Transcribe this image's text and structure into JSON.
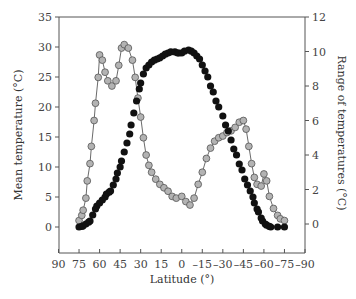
{
  "chart_data": {
    "type": "scatter",
    "title": "",
    "xlabel": "Latitude (°)",
    "ylabel": "Mean temperature (°C)",
    "ylabel_right": "Range of temperatures (°C)",
    "x_ticks": [
      90,
      75,
      60,
      45,
      30,
      15,
      0,
      -15,
      -30,
      -45,
      -60,
      -75,
      -90
    ],
    "x_tick_labels": [
      "90",
      "75",
      "60",
      "45",
      "30",
      "15",
      "0",
      "–15",
      "–30",
      "–45",
      "–60",
      "–75",
      "–90"
    ],
    "xlim": [
      90,
      -90
    ],
    "ylim": [
      -4.5,
      35
    ],
    "ylim_right": [
      -1.7,
      12
    ],
    "y_ticks": [
      0,
      5,
      10,
      15,
      20,
      25,
      30,
      35
    ],
    "y_ticks_right": [
      0,
      2,
      4,
      6,
      8,
      10,
      12
    ],
    "grid": false,
    "legend": null,
    "series": [
      {
        "name": "Mean temperature",
        "axis": "left",
        "marker": "filled-black-circle",
        "color": "#111111",
        "x": [
          75,
          73,
          72,
          70,
          68,
          67,
          65,
          63,
          62,
          60,
          58,
          56,
          55,
          53,
          52,
          50,
          48,
          47,
          45,
          44,
          42,
          40,
          38,
          37,
          35,
          33,
          31,
          30,
          28,
          26,
          24,
          22,
          20,
          18,
          16,
          14,
          12,
          10,
          8,
          5,
          3,
          2,
          0,
          -2,
          -5,
          -7,
          -9,
          -11,
          -13,
          -15,
          -17,
          -19,
          -21,
          -23,
          -25,
          -27,
          -30,
          -32,
          -34,
          -36,
          -38,
          -40,
          -42,
          -44,
          -46,
          -48,
          -50,
          -52,
          -53,
          -55,
          -56,
          -58,
          -59,
          -61,
          -62,
          -64,
          -65,
          -70,
          -75
        ],
        "y": [
          0,
          0.1,
          0.2,
          0.5,
          0.8,
          1,
          2,
          3,
          3.5,
          4,
          4.5,
          5,
          5.5,
          5.8,
          6,
          7,
          8,
          9,
          10,
          11,
          12.5,
          14,
          15.5,
          17,
          19,
          21,
          23,
          24,
          25.5,
          26.5,
          27,
          27.5,
          27.8,
          28,
          28.2,
          28.5,
          28.8,
          29,
          29.2,
          29.2,
          29,
          29,
          29,
          29.3,
          29.5,
          29.3,
          29,
          28.5,
          28,
          27,
          26,
          25,
          23.5,
          22.5,
          21,
          20,
          18.5,
          17,
          16,
          14.5,
          13,
          12,
          10.5,
          9.5,
          8,
          7,
          6,
          5,
          4,
          3,
          2.5,
          1.5,
          1,
          0.5,
          0.3,
          0.1,
          0,
          0,
          0
        ]
      },
      {
        "name": "Range of temperatures",
        "axis": "right",
        "marker": "gray-circle-connected",
        "color": "#b3b3b3",
        "x": [
          75,
          73,
          72,
          70,
          69,
          67,
          66,
          64,
          63,
          61,
          60,
          58,
          56,
          54,
          51,
          48,
          46,
          44,
          42,
          39,
          36,
          34,
          32,
          30,
          28,
          26,
          24,
          22,
          19,
          16,
          13,
          10,
          7,
          4,
          0,
          -3,
          -6,
          -9,
          -12,
          -15,
          -18,
          -21,
          -24,
          -27,
          -30,
          -33,
          -36,
          -39,
          -42,
          -45,
          -47,
          -49,
          -51,
          -53,
          -55,
          -58,
          -60,
          -62,
          -64,
          -67,
          -70,
          -72,
          -75
        ],
        "y": [
          0.2,
          0.5,
          0.8,
          1.5,
          2.5,
          3.5,
          4.5,
          6,
          7,
          8.5,
          9.8,
          9.5,
          8.8,
          8.3,
          8,
          8.3,
          9.2,
          10.2,
          10.4,
          10.2,
          9.5,
          8.5,
          7.3,
          6.2,
          5,
          4,
          3.4,
          3,
          2.6,
          2.3,
          2.1,
          1.9,
          1.6,
          1.5,
          1.6,
          1.3,
          1.1,
          1.5,
          2.3,
          3,
          3.8,
          4.4,
          4.8,
          5,
          5.1,
          5.3,
          5.4,
          5.6,
          5.9,
          6,
          5.5,
          4.5,
          3.5,
          2.7,
          2.3,
          2.2,
          2.9,
          2.5,
          1.6,
          0.9,
          0.5,
          0.3,
          0.2
        ]
      }
    ]
  },
  "axes": {
    "x_title": "Latitude (°)",
    "y_left_title": "Mean temperature (°C)",
    "y_right_title": "Range of temperatures (°C)"
  }
}
